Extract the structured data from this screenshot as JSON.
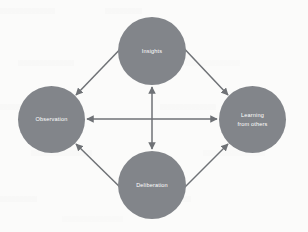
{
  "diagram": {
    "background_color": "#fbfbfa",
    "node_color": "#82858a",
    "connector_color": "#6f7276",
    "label_color": "#ffffff",
    "nodes": [
      {
        "id": "insights",
        "label": "Insights",
        "position": "top",
        "center_x": 152,
        "center_y": 51,
        "diameter": 68
      },
      {
        "id": "observation",
        "label": "Observation",
        "position": "left",
        "center_x": 51,
        "center_y": 119,
        "diameter": 67
      },
      {
        "id": "learning-from-others",
        "label": "Learning\nfrom others",
        "position": "right",
        "center_x": 252,
        "center_y": 119,
        "diameter": 67
      },
      {
        "id": "deliberation",
        "label": "Deliberation",
        "position": "bottom",
        "center_x": 152,
        "center_y": 185,
        "diameter": 68
      }
    ],
    "connectors": [
      {
        "id": "observation-insights",
        "from": "observation",
        "to": "insights",
        "arrowheads": "both",
        "orientation": "diagonal-up-right"
      },
      {
        "id": "insights-learning",
        "from": "insights",
        "to": "learning-from-others",
        "arrowheads": "both",
        "orientation": "diagonal-down-right"
      },
      {
        "id": "observation-deliberation",
        "from": "observation",
        "to": "deliberation",
        "arrowheads": "both",
        "orientation": "diagonal-down-right"
      },
      {
        "id": "deliberation-learning",
        "from": "deliberation",
        "to": "learning-from-others",
        "arrowheads": "both",
        "orientation": "diagonal-up-right"
      },
      {
        "id": "observation-learning",
        "from": "observation",
        "to": "learning-from-others",
        "arrowheads": "both",
        "orientation": "horizontal"
      },
      {
        "id": "insights-deliberation",
        "from": "insights",
        "to": "deliberation",
        "arrowheads": "both",
        "orientation": "vertical"
      }
    ]
  }
}
